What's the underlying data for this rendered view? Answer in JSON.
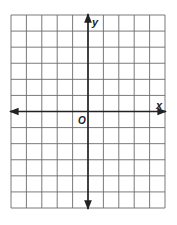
{
  "diagram": {
    "type": "coordinate-grid",
    "columns": 10,
    "rows": 12,
    "y_axis_column": 5,
    "x_axis_row": 6,
    "grid": {
      "left": 11,
      "top": 15,
      "right": 165,
      "bottom": 208
    },
    "labels": {
      "x_axis": "x",
      "y_axis": "y",
      "origin": "O"
    },
    "colors": {
      "grid_line": "#6b6b6b",
      "axis_line": "#222222",
      "background": "#ffffff"
    }
  }
}
